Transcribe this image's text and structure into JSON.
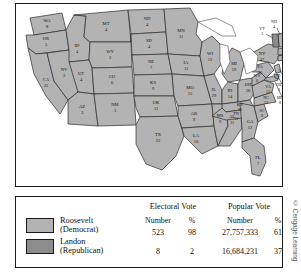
{
  "map": {
    "title": "1936 Presidential Election Electoral Vote Map",
    "colors": {
      "democrat_fill": "#b3b3b3",
      "republican_fill": "#8c8c8c",
      "border": "#2b2b2b",
      "lake": "#ffffff"
    },
    "states": [
      {
        "code": "WA",
        "votes": "8",
        "party": "dem"
      },
      {
        "code": "OR",
        "votes": "5",
        "party": "dem"
      },
      {
        "code": "CA",
        "votes": "22",
        "party": "dem"
      },
      {
        "code": "NV",
        "votes": "3",
        "party": "dem"
      },
      {
        "code": "ID",
        "votes": "4",
        "party": "dem"
      },
      {
        "code": "MT",
        "votes": "4",
        "party": "dem"
      },
      {
        "code": "WY",
        "votes": "3",
        "party": "dem"
      },
      {
        "code": "UT",
        "votes": "4",
        "party": "dem"
      },
      {
        "code": "AZ",
        "votes": "3",
        "party": "dem"
      },
      {
        "code": "CO",
        "votes": "6",
        "party": "dem"
      },
      {
        "code": "NM",
        "votes": "3",
        "party": "dem"
      },
      {
        "code": "ND",
        "votes": "4",
        "party": "dem"
      },
      {
        "code": "SD",
        "votes": "4",
        "party": "dem"
      },
      {
        "code": "NE",
        "votes": "7",
        "party": "dem"
      },
      {
        "code": "KS",
        "votes": "9",
        "party": "dem"
      },
      {
        "code": "OK",
        "votes": "11",
        "party": "dem"
      },
      {
        "code": "TX",
        "votes": "23",
        "party": "dem"
      },
      {
        "code": "MN",
        "votes": "11",
        "party": "dem"
      },
      {
        "code": "IA",
        "votes": "11",
        "party": "dem"
      },
      {
        "code": "MO",
        "votes": "15",
        "party": "dem"
      },
      {
        "code": "AR",
        "votes": "9",
        "party": "dem"
      },
      {
        "code": "LA",
        "votes": "10",
        "party": "dem"
      },
      {
        "code": "WI",
        "votes": "12",
        "party": "dem"
      },
      {
        "code": "IL",
        "votes": "29",
        "party": "dem"
      },
      {
        "code": "MS",
        "votes": "9",
        "party": "dem"
      },
      {
        "code": "AL",
        "votes": "11",
        "party": "dem"
      },
      {
        "code": "MI",
        "votes": "19",
        "party": "dem"
      },
      {
        "code": "IN",
        "votes": "14",
        "party": "dem"
      },
      {
        "code": "KY",
        "votes": "11",
        "party": "dem"
      },
      {
        "code": "TN",
        "votes": "11",
        "party": "dem"
      },
      {
        "code": "GA",
        "votes": "12",
        "party": "dem"
      },
      {
        "code": "FL",
        "votes": "7",
        "party": "dem"
      },
      {
        "code": "OH",
        "votes": "26",
        "party": "dem"
      },
      {
        "code": "WV",
        "votes": "8",
        "party": "dem"
      },
      {
        "code": "VA",
        "votes": "11",
        "party": "dem"
      },
      {
        "code": "NC",
        "votes": "13",
        "party": "dem"
      },
      {
        "code": "SC",
        "votes": "8",
        "party": "dem"
      },
      {
        "code": "PA",
        "votes": "36",
        "party": "dem"
      },
      {
        "code": "NY",
        "votes": "47",
        "party": "dem"
      },
      {
        "code": "MD",
        "votes": "8",
        "party": "dem"
      },
      {
        "code": "DE",
        "votes": "3",
        "party": "dem"
      },
      {
        "code": "NJ",
        "votes": "16",
        "party": "dem"
      },
      {
        "code": "CT",
        "votes": "8",
        "party": "dem"
      },
      {
        "code": "RI",
        "votes": "4",
        "party": "dem"
      },
      {
        "code": "MA",
        "votes": "17",
        "party": "dem"
      },
      {
        "code": "NH",
        "votes": "4",
        "party": "dem"
      },
      {
        "code": "VT",
        "votes": "3",
        "party": "rep"
      },
      {
        "code": "ME",
        "votes": "5",
        "party": "rep"
      }
    ]
  },
  "legend": {
    "group_headers": {
      "electoral": "Electoral Vote",
      "popular": "Popular Vote"
    },
    "column_headers": {
      "electoral_number": "Number",
      "electoral_pct": "%",
      "popular_number": "Number",
      "popular_pct": "%"
    },
    "rows": [
      {
        "candidate": "Roosevelt",
        "party": "(Democrat)",
        "swatch": "democrat-swatch",
        "electoral_number": "523",
        "electoral_pct": "98",
        "popular_number": "27,757,333",
        "popular_pct": "61"
      },
      {
        "candidate": "Landon",
        "party": "(Republican)",
        "swatch": "republican-swatch",
        "electoral_number": "8",
        "electoral_pct": "2",
        "popular_number": "16,684,231",
        "popular_pct": "37"
      }
    ]
  },
  "credit": "© Cengage Learning"
}
